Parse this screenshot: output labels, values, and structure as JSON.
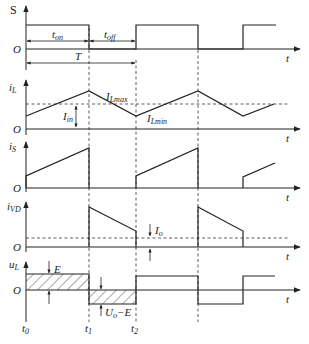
{
  "figure": {
    "panels": [
      {
        "id": "S",
        "ylabel": "S",
        "xlabel": "t",
        "origin": "O"
      },
      {
        "id": "iL",
        "ylabel": "i",
        "ylabel_sub": "L",
        "xlabel": "t",
        "origin": "O"
      },
      {
        "id": "iS",
        "ylabel": "i",
        "ylabel_sub": "S",
        "xlabel": "t",
        "origin": "O"
      },
      {
        "id": "iVD",
        "ylabel": "i",
        "ylabel_sub": "VD",
        "xlabel": "t",
        "origin": "O"
      },
      {
        "id": "uL",
        "ylabel": "u",
        "ylabel_sub": "L",
        "xlabel": "t",
        "origin": "O"
      }
    ],
    "annotations": {
      "t_on": "t",
      "t_on_sub": "on",
      "t_off": "t",
      "t_off_sub": "off",
      "period": "T",
      "i_lmax": "I",
      "i_lmax_sub": "Lmax",
      "i_lmin": "I",
      "i_lmin_sub": "Lmin",
      "i_in": "I",
      "i_in_sub": "in",
      "i_o": "I",
      "i_o_sub": "o",
      "e": "E",
      "uo_minus_e": "U",
      "uo_minus_e_sub": "o",
      "uo_minus_e_rest": "−E"
    },
    "time_labels": [
      {
        "main": "t",
        "sub": "0"
      },
      {
        "main": "t",
        "sub": "1"
      },
      {
        "main": "t",
        "sub": "2"
      }
    ],
    "colors": {
      "line": "#222222",
      "background": "#ffffff"
    }
  }
}
